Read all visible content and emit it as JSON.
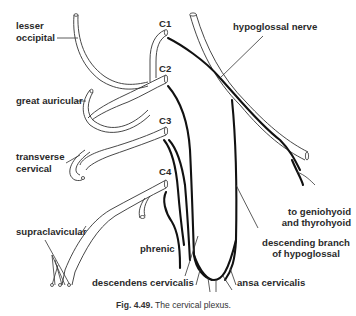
{
  "figure": {
    "title": "The cervical plexus.",
    "number": "Fig. 4.49.",
    "spinal_levels": [
      "C1",
      "C2",
      "C3",
      "C4"
    ],
    "labels": {
      "lesser_occipital_1": "lesser",
      "lesser_occipital_2": "occipital",
      "great_auricular": "great auricular",
      "transverse_cervical_1": "transverse",
      "transverse_cervical_2": "cervical",
      "supraclavicular": "supraclavicular",
      "phrenic": "phrenic",
      "descendens_cervicalis": "descendens cervicalis",
      "ansa_cervicalis": "ansa cervicalis",
      "hypoglossal_nerve": "hypoglossal nerve",
      "geniohyoid_1": "to geniohyoid",
      "geniohyoid_2": "and thyrohyoid",
      "descending_branch_1": "descending branch",
      "descending_branch_2": "of hypoglossal"
    }
  }
}
